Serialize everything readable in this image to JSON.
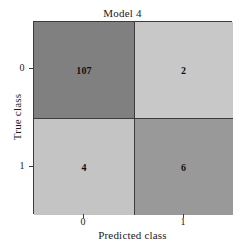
{
  "chart_data": {
    "type": "heatmap",
    "title": "Model 4",
    "xlabel": "Predicted class",
    "ylabel": "True class",
    "x_tick_labels": [
      "0",
      "1"
    ],
    "y_tick_labels": [
      "0",
      "1"
    ],
    "categories": [
      "0",
      "1"
    ],
    "grid": true,
    "legend": "none",
    "matrix": [
      [
        107,
        2
      ],
      [
        4,
        6
      ]
    ],
    "cells": [
      {
        "row": "0",
        "col": "0",
        "value": "107",
        "color": "#808080"
      },
      {
        "row": "0",
        "col": "1",
        "value": "2",
        "color": "#c8c8c8"
      },
      {
        "row": "1",
        "col": "0",
        "value": "4",
        "color": "#c4c4c4"
      },
      {
        "row": "1",
        "col": "1",
        "value": "6",
        "color": "#999999"
      }
    ],
    "colors": {
      "cell_0_0": "#808080",
      "cell_0_1": "#c8c8c8",
      "cell_1_0": "#c4c4c4",
      "cell_1_1": "#999999",
      "axis": "#3c3c3c",
      "text": "#1a1a1a",
      "background": "#ffffff"
    }
  }
}
